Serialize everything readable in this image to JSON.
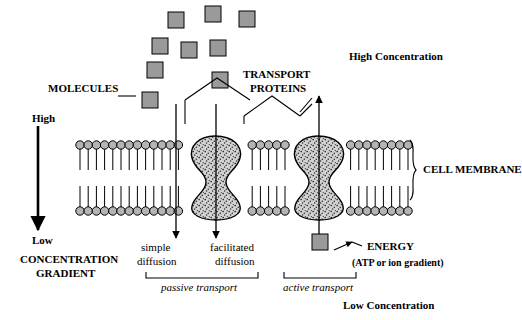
{
  "diagram": {
    "title_elements": {
      "molecules": "MOLECULES",
      "transport_proteins_line1": "TRANSPORT",
      "transport_proteins_line2": "PROTEINS",
      "high_concentration": "High Concentration",
      "low_concentration": "Low Concentration",
      "cell_membrane": "CELL MEMBRANE",
      "energy": "ENERGY",
      "energy_sub": "(ATP or ion gradient)"
    },
    "gradient_axis": {
      "high": "High",
      "low": "Low",
      "caption_line1": "CONCENTRATION",
      "caption_line2": "GRADIENT"
    },
    "mechanisms": [
      {
        "name": "simple-diffusion",
        "line1": "simple",
        "line2": "diffusion"
      },
      {
        "name": "facilitated-diffusion",
        "line1": "facilitated",
        "line2": "diffusion"
      },
      {
        "name": "active-transport-column",
        "line1": "",
        "line2": ""
      }
    ],
    "transport_types": {
      "passive": "passive transport",
      "active": "active transport"
    },
    "colors": {
      "molecule_fill": "#9a9a9a",
      "molecule_stroke": "#000000",
      "lipid_head_fill": "#b4b4b4",
      "protein_fill": "#cfcfcf",
      "line": "#000000",
      "background": "#ffffff"
    },
    "molecules": {
      "cloud_count": 8,
      "channel_entry_count": 2,
      "energy_molecule_count": 1
    }
  }
}
